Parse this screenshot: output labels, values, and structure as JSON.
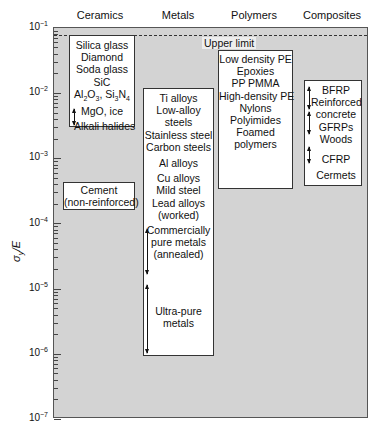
{
  "chart_data": {
    "type": "range-box",
    "title": "",
    "xlabel": "",
    "ylabel": "σy/E",
    "yscale": "log",
    "ylim": [
      1e-07,
      0.1
    ],
    "yticks": [
      "10-1",
      "10-2",
      "10-3",
      "10-4",
      "10-5",
      "10-6",
      "10-7"
    ],
    "categories": [
      "Ceramics",
      "Metals",
      "Polymers",
      "Composites"
    ],
    "upper_limit": {
      "label": "Upper limit",
      "value": 0.07
    },
    "groups": [
      {
        "category": "Ceramics",
        "range": [
          0.003,
          0.07
        ],
        "items": [
          "Silica glass",
          "Diamond",
          "Soda glass",
          "SiC",
          "Al2O3, Si3N4",
          "MgO, ice",
          "Alkali halides"
        ]
      },
      {
        "category": "Ceramics",
        "range": [
          0.00018,
          0.00045
        ],
        "items": [
          "Cement",
          "(non-reinforced)"
        ]
      },
      {
        "category": "Metals",
        "range": [
          8e-07,
          0.01
        ],
        "items": [
          "Ti alloys",
          "Low-alloy",
          "steels",
          "Stainless steel",
          "Carbon steels",
          "Al alloys",
          "Cu alloys",
          "Mild steel",
          "Lead alloys",
          "(worked)",
          "Commercially",
          "pure metals",
          "(annealed)",
          "Ultra-pure",
          "metals"
        ]
      },
      {
        "category": "Polymers",
        "range": [
          0.0007,
          0.05
        ],
        "items": [
          "Low density PE",
          "Epoxies",
          "PP PMMA",
          "High-density PE",
          "Nylons",
          "Polyimides",
          "Foamed",
          "polymers"
        ]
      },
      {
        "category": "Composites",
        "range": [
          0.0008,
          0.015
        ],
        "items": [
          "BFRP",
          "Reinforced",
          "concrete",
          "GFRPs",
          "Woods",
          "CFRP",
          "Cermets"
        ]
      }
    ],
    "grid": false,
    "legend": "none"
  },
  "axis": {
    "ylabel": "σ",
    "ylabel_sub": "y",
    "ylabel_rest": "/E",
    "ticks": [
      {
        "base": "10",
        "exp": "−1"
      },
      {
        "base": "10",
        "exp": "−2"
      },
      {
        "base": "10",
        "exp": "−3"
      },
      {
        "base": "10",
        "exp": "−4"
      },
      {
        "base": "10",
        "exp": "−5"
      },
      {
        "base": "10",
        "exp": "−6"
      },
      {
        "base": "10",
        "exp": "−7"
      }
    ]
  },
  "headers": {
    "ceramics": "Ceramics",
    "metals": "Metals",
    "polymers": "Polymers",
    "composites": "Composites"
  },
  "upper_limit_label": "Upper limit",
  "ceramics": {
    "l1": "Silica glass",
    "l2": "Diamond",
    "l3": "Soda glass",
    "l4": "SiC",
    "l5a": "Al",
    "l5b": "2",
    "l5c": "O",
    "l5d": "3",
    "l5e": ", Si",
    "l5f": "3",
    "l5g": "N",
    "l5h": "4",
    "l6": "MgO, ice",
    "l7": "Alkali halides"
  },
  "cement": {
    "l1": "Cement",
    "l2": "(non-reinforced)"
  },
  "metals": {
    "l1": "Ti alloys",
    "l2": "Low-alloy",
    "l3": "steels",
    "l4": "Stainless steel",
    "l5": "Carbon steels",
    "l6": "Al alloys",
    "l7": "Cu alloys",
    "l8": "Mild steel",
    "l9": "Lead alloys",
    "l10": "(worked)",
    "l11": "Commercially",
    "l12": "pure metals",
    "l13": "(annealed)",
    "l14": "Ultra-pure",
    "l15": "metals"
  },
  "polymers": {
    "l1": "Low density PE",
    "l2": "Epoxies",
    "l3": "PP PMMA",
    "l4": "High-density PE",
    "l5": "Nylons",
    "l6": "Polyimides",
    "l7": "Foamed",
    "l8": "polymers"
  },
  "composites": {
    "l1": "BFRP",
    "l2": "Reinforced",
    "l3": "concrete",
    "l4": "GFRPs",
    "l5": "Woods",
    "l6": "CFRP",
    "l7": "Cermets"
  }
}
